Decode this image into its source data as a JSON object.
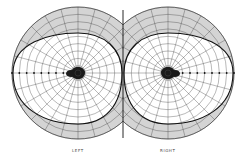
{
  "figure": {
    "background": "#ffffff",
    "grid_color": "#333333",
    "shade_color": "#d4d4d4",
    "boundary_color": "#111111",
    "blind_spot_color": "#1a1a1a"
  },
  "eyes": [
    {
      "label": "LEFT",
      "center": [
        78,
        73
      ],
      "outer_radius": 66,
      "blind_spot_side": "temporal-left",
      "field_boundary": {
        "up": 40,
        "down": 51,
        "temporal": 65,
        "nasal": 44
      }
    },
    {
      "label": "RIGHT",
      "center": [
        168,
        73
      ],
      "outer_radius": 66,
      "blind_spot_side": "temporal-right",
      "field_boundary": {
        "up": 40,
        "down": 51,
        "temporal": 65,
        "nasal": 44
      }
    }
  ],
  "grid": {
    "rings": 9,
    "radial_lines": 24
  }
}
